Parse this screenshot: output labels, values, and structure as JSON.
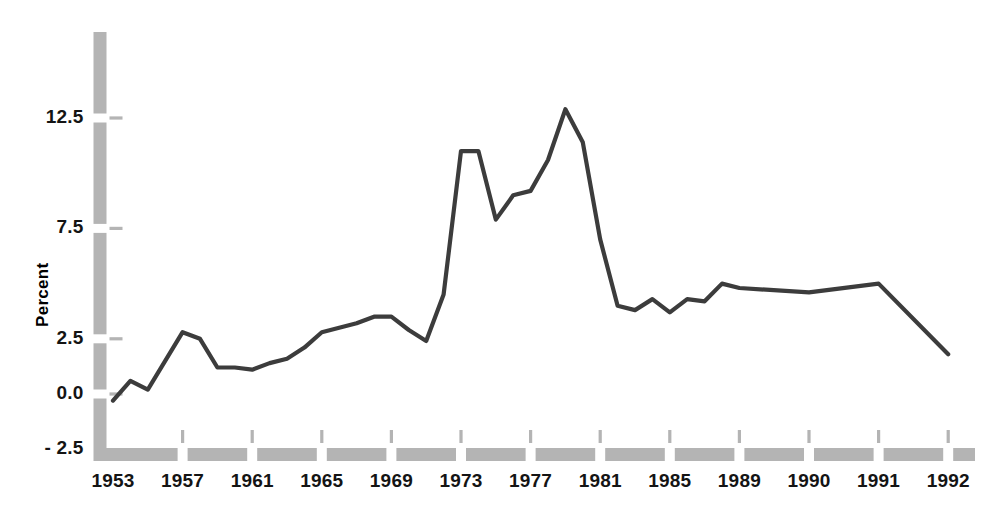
{
  "chart_data": {
    "type": "line",
    "title": "",
    "subtitle": "",
    "xlabel": "",
    "ylabel": "Percent",
    "ylim": [
      -2.5,
      14.5
    ],
    "yticks": [
      12.5,
      7.5,
      2.5,
      0.0,
      -2.5
    ],
    "ytick_labels": [
      "12.5",
      "7.5",
      "2.5",
      "0.0",
      "- 2.5"
    ],
    "xtick_labels": [
      "1953",
      "1957",
      "1961",
      "1965",
      "1969",
      "1973",
      "1977",
      "1981",
      "1985",
      "1989",
      "1990",
      "1991",
      "1992"
    ],
    "grid": false,
    "legend": "none",
    "line_color": "#3c3c3c",
    "axis_color": "#b4b4b4",
    "categories": [
      1953,
      1954,
      1955,
      1956,
      1957,
      1958,
      1959,
      1960,
      1961,
      1962,
      1963,
      1964,
      1965,
      1966,
      1967,
      1968,
      1969,
      1970,
      1971,
      1972,
      1973,
      1974,
      1975,
      1976,
      1977,
      1978,
      1979,
      1980,
      1981,
      1982,
      1983,
      1984,
      1985,
      1986,
      1987,
      1988,
      1989,
      1990,
      1991,
      1992
    ],
    "values": [
      -0.3,
      0.6,
      0.2,
      1.5,
      2.8,
      2.5,
      1.2,
      1.2,
      1.1,
      1.4,
      1.6,
      2.1,
      2.8,
      3.0,
      3.2,
      3.5,
      3.5,
      2.9,
      2.4,
      4.5,
      11.0,
      11.0,
      7.9,
      9.0,
      9.2,
      10.6,
      12.9,
      11.4,
      7.0,
      4.0,
      3.8,
      4.3,
      3.7,
      4.3,
      4.2,
      5.0,
      4.8,
      4.6,
      5.0,
      1.8
    ],
    "series_name": "Percent"
  },
  "axis": {
    "y_title": "Percent"
  }
}
